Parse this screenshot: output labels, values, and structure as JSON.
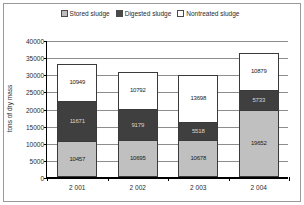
{
  "chart_data": {
    "type": "bar",
    "subtype": "stacked-vertical",
    "title": "",
    "xlabel": "",
    "ylabel": "tons of dry mass",
    "ylim": [
      0,
      40000
    ],
    "ytick_step": 5000,
    "yticks": [
      "0",
      "5000",
      "10000",
      "15000",
      "20000",
      "25000",
      "30000",
      "35000",
      "40000"
    ],
    "grid": "horizontal",
    "legend_position": "top",
    "categories": [
      "2 001",
      "2 002",
      "2 003",
      "2 004"
    ],
    "series": [
      {
        "name": "Stored sludge",
        "color": "#c0c0c0",
        "values": [
          10457,
          10695,
          10678,
          19652
        ],
        "labels": [
          "10457",
          "10695",
          "10678",
          "19652"
        ]
      },
      {
        "name": "Digested sludge",
        "color": "#3f3f3f",
        "values": [
          11671,
          9179,
          5518,
          5733
        ],
        "labels": [
          "11671",
          "9179",
          "5518",
          "5733"
        ]
      },
      {
        "name": "Nontreated sludge",
        "color": "#ffffff",
        "values": [
          10949,
          10792,
          13698,
          10879
        ],
        "labels": [
          "10949",
          "10792",
          "13698",
          "10879"
        ]
      }
    ],
    "totals": [
      33077,
      30666,
      29894,
      36264
    ]
  },
  "legend": {
    "items": [
      {
        "label": "Stored sludge"
      },
      {
        "label": "Digested sludge"
      },
      {
        "label": "Nontreated sludge"
      }
    ]
  },
  "axes": {
    "y_title": "tons of dry mass"
  }
}
